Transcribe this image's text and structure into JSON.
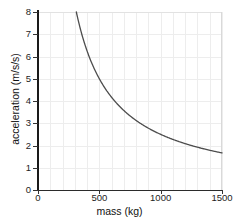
{
  "chart_data": {
    "type": "line",
    "title": "",
    "xlabel": "mass (kg)",
    "ylabel": "acceleration (m/s/s)",
    "xlim": [
      0,
      1500
    ],
    "ylim": [
      0,
      8
    ],
    "xticks": [
      0,
      500,
      1000,
      1500
    ],
    "xtick_labels": [
      "0",
      "500",
      "1000",
      "1500"
    ],
    "yticks": [
      0,
      1,
      2,
      3,
      4,
      5,
      6,
      7,
      8
    ],
    "ytick_labels": [
      "0",
      "1",
      "2",
      "3",
      "4",
      "5",
      "6",
      "7",
      "8"
    ],
    "grid": true,
    "grid_x_step": 100,
    "grid_y_step": 1,
    "legend": "none",
    "relationship": "a = F / m, inverse proportionality (hyperbola)",
    "force_constant_N": 2500,
    "line_color": "#4d4d4d",
    "grid_color": "#ededed",
    "axis_color": "#1a1a1a",
    "background": "#ffffff",
    "series": [
      {
        "name": "acceleration vs mass",
        "x": [
          310,
          350,
          400,
          450,
          500,
          550,
          600,
          650,
          700,
          750,
          800,
          850,
          900,
          950,
          1000,
          1050,
          1100,
          1150,
          1200,
          1250,
          1300,
          1350,
          1400,
          1450,
          1500
        ],
        "values": [
          8.06,
          7.14,
          6.25,
          5.56,
          5.0,
          4.55,
          4.17,
          3.85,
          3.57,
          3.33,
          3.13,
          2.94,
          2.78,
          2.63,
          2.5,
          2.38,
          2.27,
          2.17,
          2.08,
          2.0,
          1.92,
          1.85,
          1.79,
          1.72,
          1.67
        ]
      }
    ]
  }
}
